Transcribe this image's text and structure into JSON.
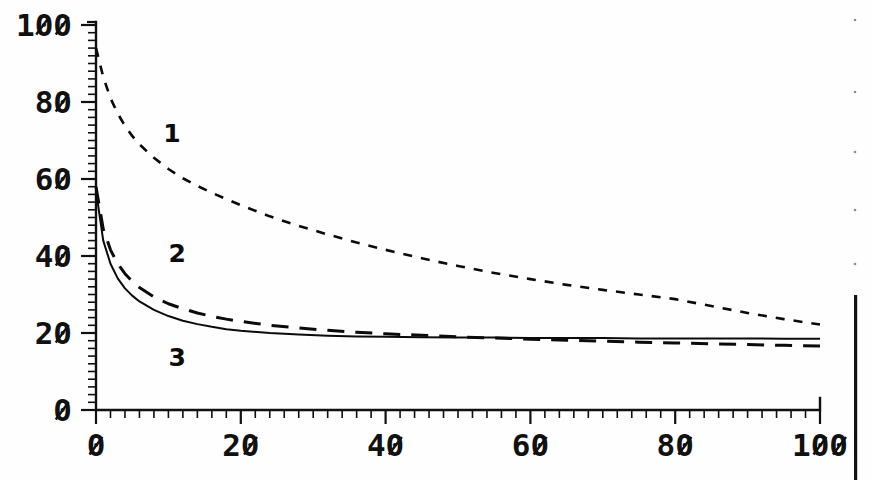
{
  "figure": {
    "background_color": "#fefefe",
    "ink_color": "#101010",
    "zero_glyph_style": "slashed-zero"
  },
  "axes": {
    "x": {
      "min": 0,
      "max": 100,
      "tick_labels": [
        "0",
        "20",
        "40",
        "60",
        "80",
        "100"
      ],
      "tick_values": [
        0,
        20,
        40,
        60,
        80,
        100
      ],
      "minor_tick_step": 2,
      "label": ""
    },
    "y": {
      "min": 0,
      "max": 100,
      "tick_labels": [
        "0",
        "20",
        "40",
        "60",
        "80",
        "100"
      ],
      "tick_values": [
        0,
        20,
        40,
        60,
        80,
        100
      ],
      "minor_tick_step": 2,
      "label": ""
    }
  },
  "annotations": [
    {
      "text": "1",
      "x_data": 10.5,
      "y_data": 69.5
    },
    {
      "text": "2",
      "x_data": 11.2,
      "y_data": 38.5
    },
    {
      "text": "3",
      "x_data": 11.2,
      "y_data": 11.5
    }
  ],
  "chart_data": {
    "type": "line",
    "title": "",
    "subtitle": "",
    "xlabel": "",
    "ylabel": "",
    "xlim": [
      0,
      100
    ],
    "ylim": [
      0,
      100
    ],
    "grid": false,
    "legend": "inline-curve-labels",
    "x": [
      0,
      1,
      2,
      3,
      4,
      5,
      6,
      8,
      10,
      12,
      14,
      16,
      18,
      20,
      24,
      28,
      32,
      36,
      40,
      45,
      50,
      55,
      60,
      65,
      70,
      75,
      80,
      85,
      90,
      95,
      100
    ],
    "series": [
      {
        "name": "1",
        "label": "1",
        "line_style": "short-dashed",
        "values": [
          94.0,
          86.5,
          81.0,
          77.0,
          73.8,
          71.2,
          69.0,
          65.5,
          62.6,
          60.2,
          58.2,
          56.4,
          54.8,
          53.2,
          50.3,
          47.8,
          45.6,
          43.5,
          41.6,
          39.4,
          37.4,
          35.6,
          34.0,
          32.5,
          31.2,
          30.0,
          28.8,
          27.0,
          25.2,
          23.6,
          22.2
        ]
      },
      {
        "name": "2",
        "label": "2",
        "line_style": "long-dashed",
        "values": [
          58.0,
          47.0,
          41.6,
          38.0,
          35.4,
          33.4,
          31.8,
          29.4,
          27.6,
          26.3,
          25.2,
          24.3,
          23.6,
          23.0,
          22.0,
          21.3,
          20.7,
          20.2,
          19.8,
          19.4,
          19.0,
          18.7,
          18.4,
          18.1,
          17.9,
          17.6,
          17.4,
          17.2,
          17.0,
          16.8,
          16.6
        ]
      },
      {
        "name": "3",
        "label": "3",
        "line_style": "solid",
        "values": [
          57.0,
          44.0,
          38.0,
          34.2,
          31.6,
          29.7,
          28.2,
          26.0,
          24.4,
          23.2,
          22.3,
          21.6,
          21.0,
          20.6,
          20.0,
          19.6,
          19.3,
          19.1,
          19.0,
          18.9,
          18.8,
          18.8,
          18.7,
          18.7,
          18.7,
          18.6,
          18.6,
          18.6,
          18.6,
          18.5,
          18.5
        ]
      }
    ]
  },
  "artifacts": {
    "right_edge_bar": {
      "present": true,
      "x_px": 854,
      "y_top_px": 295,
      "y_bottom_px": 480
    },
    "specks": [
      {
        "x_px": 855,
        "y_px": 20
      },
      {
        "x_px": 855,
        "y_px": 92
      },
      {
        "x_px": 855,
        "y_px": 152
      },
      {
        "x_px": 855,
        "y_px": 210
      },
      {
        "x_px": 855,
        "y_px": 264
      }
    ]
  }
}
